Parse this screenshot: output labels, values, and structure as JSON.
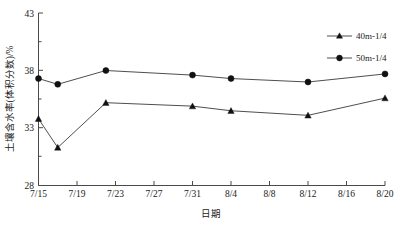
{
  "chart_data": {
    "type": "line",
    "title": "",
    "xlabel": "日期",
    "ylabel": "土壤含水率(体积分数)/%",
    "x": [
      "7/15",
      "7/19",
      "7/23",
      "7/27",
      "7/31",
      "8/4",
      "8/8",
      "8/12",
      "8/16",
      "8/20"
    ],
    "xtick_labels": [
      "7/15",
      "7/19",
      "7/23",
      "7/27",
      "7/31",
      "8/4",
      "8/8",
      "8/12",
      "8/16",
      "8/20"
    ],
    "ytick_labels": [
      "28",
      "33",
      "38",
      "43"
    ],
    "yticks": [
      28,
      33,
      38,
      43
    ],
    "ylim": [
      28,
      43
    ],
    "grid": false,
    "legend_position": "top-right",
    "series": [
      {
        "name": "40m-1/4",
        "marker": "triangle",
        "color": "#111111",
        "x": [
          "7/15",
          "7/17",
          "7/22",
          "7/31",
          "8/4",
          "8/12",
          "8/20"
        ],
        "x_index": [
          0,
          0.5,
          1.75,
          4,
          5,
          7,
          9
        ],
        "values": [
          33.8,
          31.3,
          35.2,
          34.9,
          34.5,
          34.1,
          35.6
        ]
      },
      {
        "name": "50m-1/4",
        "marker": "circle",
        "color": "#111111",
        "x": [
          "7/15",
          "7/17",
          "7/22",
          "7/31",
          "8/4",
          "8/12",
          "8/20"
        ],
        "x_index": [
          0,
          0.5,
          1.75,
          4,
          5,
          7,
          9
        ],
        "values": [
          37.3,
          36.8,
          38.0,
          37.6,
          37.3,
          37.0,
          37.7
        ]
      }
    ]
  },
  "legend": {
    "items": [
      {
        "label": "40m-1/4",
        "marker": "triangle"
      },
      {
        "label": "50m-1/4",
        "marker": "circle"
      }
    ]
  },
  "axes": {
    "y_title": "土壤含水率(体积分数)/%",
    "x_title": "日期",
    "y_ticks": [
      {
        "label": "43"
      },
      {
        "label": "38"
      },
      {
        "label": "33"
      },
      {
        "label": "28"
      }
    ],
    "x_ticks": [
      {
        "label": "7/15"
      },
      {
        "label": "7/19"
      },
      {
        "label": "7/23"
      },
      {
        "label": "7/27"
      },
      {
        "label": "7/31"
      },
      {
        "label": "8/4"
      },
      {
        "label": "8/8"
      },
      {
        "label": "8/12"
      },
      {
        "label": "8/16"
      },
      {
        "label": "8/20"
      }
    ]
  },
  "colors": {
    "axis": "#4a4a4a",
    "line": "#3a3a3a",
    "marker": "#111111",
    "text": "#1a1a1a",
    "background": "#ffffff"
  }
}
